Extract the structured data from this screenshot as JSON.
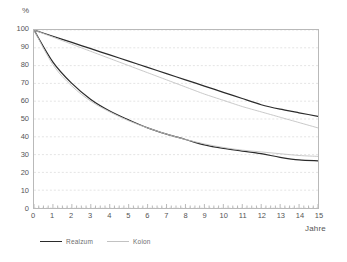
{
  "chart_data": {
    "type": "line",
    "title": "",
    "xlabel": "Jahre",
    "ylabel": "%",
    "xlim": [
      0,
      15
    ],
    "ylim": [
      0,
      100
    ],
    "grid": true,
    "grid_orientation": "horizontal",
    "legend_position": "bottom-left",
    "xticks": [
      "0",
      "1",
      "2",
      "3",
      "4",
      "5",
      "6",
      "7",
      "8",
      "9",
      "10",
      "11",
      "12",
      "13",
      "14",
      "15"
    ],
    "yticks": [
      "0",
      "10",
      "20",
      "30",
      "40",
      "50",
      "60",
      "70",
      "80",
      "90",
      "100"
    ],
    "x": [
      0,
      1,
      2,
      3,
      4,
      5,
      6,
      7,
      8,
      9,
      10,
      11,
      12,
      13,
      14,
      15
    ],
    "series": [
      {
        "name": "Realzum",
        "style": "upper-linear",
        "color": "#2b2b2b",
        "values": [
          100,
          96.5,
          93,
          89.5,
          86,
          82.5,
          79,
          75.5,
          72,
          68.5,
          65,
          61.5,
          58,
          55.5,
          53.5,
          51.5
        ]
      },
      {
        "name": "Koion",
        "style": "upper-linear",
        "color": "#c2c2c2",
        "values": [
          100,
          96,
          92,
          88,
          84,
          80,
          76,
          72,
          68,
          64,
          60.5,
          57,
          54,
          51,
          48,
          45
        ]
      },
      {
        "name": "Realzum",
        "style": "lower-decay",
        "color": "#2b2b2b",
        "values": [
          100,
          82,
          70,
          61,
          54.5,
          49.5,
          45,
          41.5,
          38.5,
          35.5,
          33.5,
          32,
          30.5,
          28.5,
          27,
          26.5
        ]
      },
      {
        "name": "Koion",
        "style": "lower-decay",
        "color": "#c2c2c2",
        "values": [
          100,
          80.5,
          68.5,
          60,
          54,
          49,
          45,
          41.5,
          38.5,
          36,
          34,
          32.5,
          31.5,
          30.5,
          29.5,
          29
        ]
      }
    ]
  },
  "axes": {
    "y_title": "%",
    "x_title": "Jahre"
  },
  "legend": {
    "items": [
      {
        "label": "Realzum",
        "color": "#2b2b2b"
      },
      {
        "label": "Koion",
        "color": "#c2c2c2"
      }
    ]
  }
}
